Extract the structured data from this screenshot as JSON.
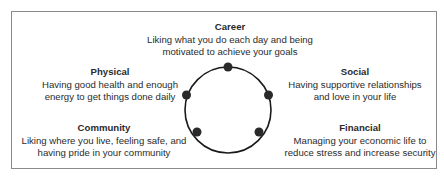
{
  "diagram": {
    "center_shape": "circle",
    "nodes": [
      {
        "title": "Career",
        "description_line1": "Liking what you do each day and being",
        "description_line2": "motivated to achieve your goals",
        "position": "top"
      },
      {
        "title": "Social",
        "description_line1": "Having supportive relationships",
        "description_line2": "and love in your life",
        "position": "right"
      },
      {
        "title": "Financial",
        "description_line1": "Managing your economic life to",
        "description_line2": "reduce stress and increase security",
        "position": "bottom-right"
      },
      {
        "title": "Community",
        "description_line1": "Liking where you live, feeling safe, and",
        "description_line2": "having pride in your community",
        "position": "bottom-left"
      },
      {
        "title": "Physical",
        "description_line1": "Having good health and enough",
        "description_line2": "energy to get things done daily",
        "position": "left"
      }
    ],
    "colors": {
      "circle": "#1a1a1a",
      "dots": "#2a2a2a",
      "border": "#8a8a8a",
      "text": "#2b2b2b"
    }
  }
}
